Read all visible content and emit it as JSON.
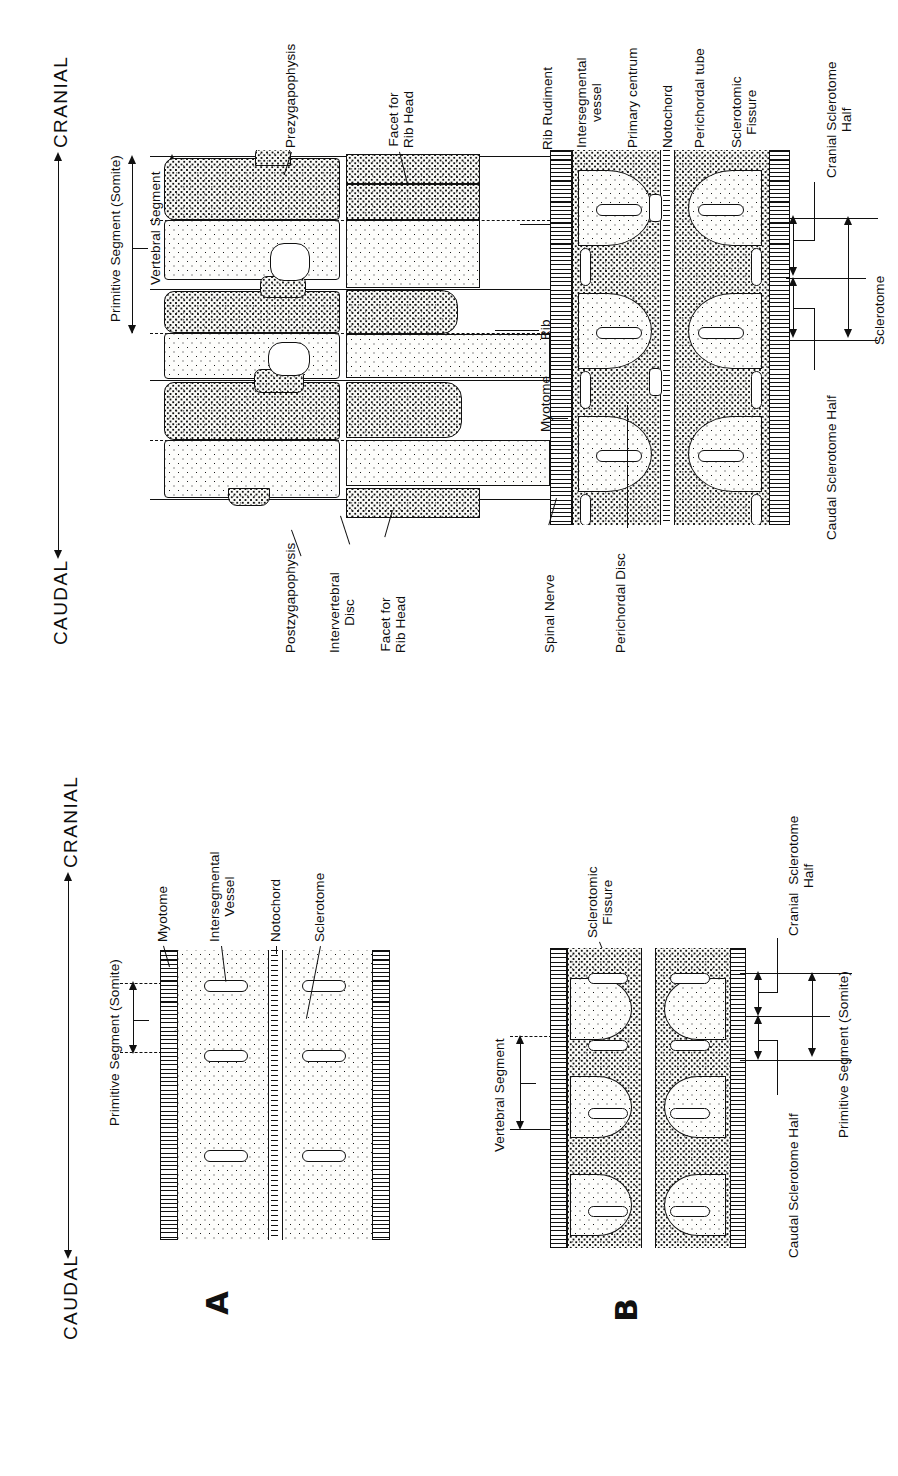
{
  "figure": {
    "orientation": "rotated-90-ccw",
    "axis": {
      "cranial": "CRANIAL",
      "caudal": "CAUDAL"
    },
    "panels": [
      {
        "id": "A",
        "label": "A"
      },
      {
        "id": "B",
        "label": "B"
      },
      {
        "id": "C",
        "label": ""
      }
    ]
  },
  "panel_a": {
    "id": "A",
    "bracket_label": "Primitive Segment (Somite)",
    "labels": [
      {
        "key": "myotome",
        "text": "Myotome"
      },
      {
        "key": "intersegmental_vessel",
        "text": "Intersegmental\nVessel"
      },
      {
        "key": "notochord",
        "text": "Notochord"
      },
      {
        "key": "sclerotome",
        "text": "Sclerotome"
      }
    ]
  },
  "panel_b": {
    "id": "B",
    "labels": [
      {
        "key": "sclerotomic_fissure",
        "text": "Sclerotomic\nFissure"
      },
      {
        "key": "vertebral_segment",
        "text": "Vertebral Segment"
      },
      {
        "key": "cranial_sclerotome_half",
        "text": "Cranial  Sclerotome\nHalf"
      },
      {
        "key": "caudal_sclerotome_half",
        "text": "Caudal Sclerotome Half"
      },
      {
        "key": "primitive_segment",
        "text": "Primitive Segment (Somite)"
      }
    ]
  },
  "panel_c": {
    "id": "C",
    "axis": {
      "cranial": "CRANIAL",
      "caudal": "CAUDAL"
    },
    "brackets": [
      {
        "key": "primitive_segment",
        "text": "Primitive Segment (Somite)"
      },
      {
        "key": "vertebral_segment",
        "text": "Vertebral Segment"
      },
      {
        "key": "sclerotome",
        "text": "Sclerotome"
      },
      {
        "key": "cranial_sclerotome_half",
        "text": "Cranial Sclerotome\nHalf"
      },
      {
        "key": "caudal_sclerotome_half",
        "text": "Caudal Sclerotome Half"
      }
    ],
    "labels_top": [
      {
        "key": "prezygapophysis",
        "text": "Prezygapophysis"
      },
      {
        "key": "facet_for_rib_head_top",
        "text": "Facet for\nRib Head"
      },
      {
        "key": "rib_rudiment",
        "text": "Rib Rudiment"
      },
      {
        "key": "intersegmental_vessel",
        "text": "Intersegmental\nvessel"
      },
      {
        "key": "primary_centrum",
        "text": "Primary centrum"
      },
      {
        "key": "notochord",
        "text": "Notochord"
      },
      {
        "key": "perichordal_tube",
        "text": "Perichordal tube"
      },
      {
        "key": "sclerotomic_fissure",
        "text": "Sclerotomic\nFissure"
      }
    ],
    "labels_bottom": [
      {
        "key": "postzygapophysis",
        "text": "Postzygapophysis"
      },
      {
        "key": "intervertebral_disc",
        "text": "Intervertebral\nDisc"
      },
      {
        "key": "facet_for_rib_head_bottom",
        "text": "Facet for\nRib Head"
      },
      {
        "key": "spinal_nerve",
        "text": "Spinal Nerve"
      },
      {
        "key": "perichordal_disc",
        "text": "Perichordal Disc"
      }
    ],
    "labels_mid": [
      {
        "key": "rib",
        "text": "Rib"
      },
      {
        "key": "myotome",
        "text": "Myotome"
      }
    ]
  },
  "colors": {
    "ink": "#101010",
    "paper": "#ffffff",
    "stipple_light": "#fdfdfb",
    "stipple_dense": "#fbfbf8"
  }
}
